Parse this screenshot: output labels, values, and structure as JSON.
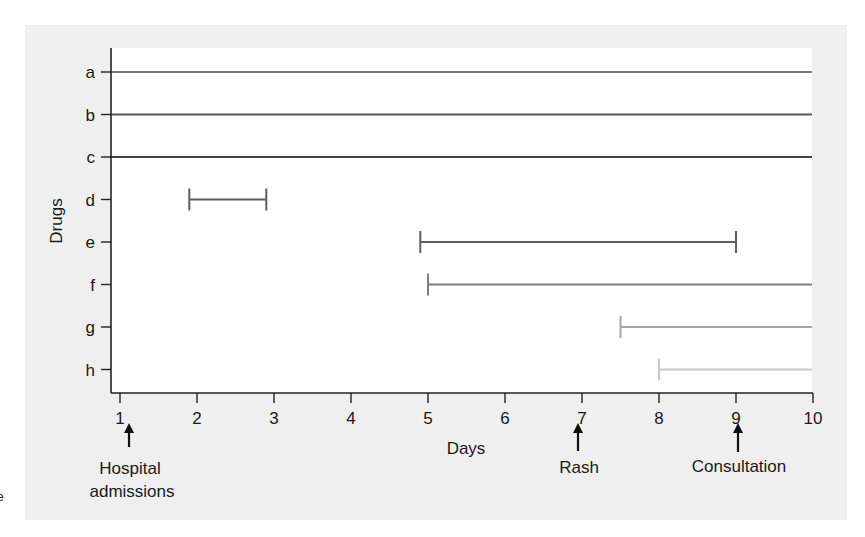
{
  "chart_data": {
    "type": "timeline",
    "title": "",
    "xlabel": "Days",
    "ylabel": "Drugs",
    "xlim": [
      1,
      10
    ],
    "x_ticks": [
      1,
      2,
      3,
      4,
      5,
      6,
      7,
      8,
      9,
      10
    ],
    "grid": false,
    "categories": [
      "a",
      "b",
      "c",
      "d",
      "e",
      "f",
      "g",
      "h"
    ],
    "series": [
      {
        "name": "a",
        "start": 1,
        "end": 10,
        "continues": true,
        "color": "#7a7a7a"
      },
      {
        "name": "b",
        "start": 1,
        "end": 10,
        "continues": true,
        "color": "#5a5a5a"
      },
      {
        "name": "c",
        "start": 1,
        "end": 10,
        "continues": true,
        "color": "#444444"
      },
      {
        "name": "d",
        "start": 1.9,
        "end": 2.9,
        "continues": false,
        "color": "#5e5e5e"
      },
      {
        "name": "e",
        "start": 4.9,
        "end": 9.0,
        "continues": false,
        "color": "#5e5e5e"
      },
      {
        "name": "f",
        "start": 5.0,
        "end": 10,
        "continues": true,
        "color": "#7d7d7d"
      },
      {
        "name": "g",
        "start": 7.5,
        "end": 10,
        "continues": true,
        "color": "#a5a5a5"
      },
      {
        "name": "h",
        "start": 8.0,
        "end": 10,
        "continues": true,
        "color": "#c8c8c8"
      }
    ],
    "annotations": [
      {
        "x": 1,
        "label_lines": [
          "Hospital",
          "admissions"
        ]
      },
      {
        "x": 7,
        "label_lines": [
          "Rash"
        ]
      },
      {
        "x": 9,
        "label_lines": [
          "Consultation"
        ]
      }
    ]
  },
  "labels": {
    "xlabel": "Days",
    "ylabel": "Drugs",
    "ann_hospital_1": "Hospital",
    "ann_hospital_2": "admissions",
    "ann_rash": "Rash",
    "ann_consult": "Consultation",
    "edge_fragment": "e"
  },
  "colors": {
    "panel": "#efefef",
    "plot_bg": "#ffffff",
    "axis": "#222222"
  }
}
